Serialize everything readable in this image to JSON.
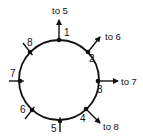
{
  "diagram": {
    "type": "ring-network",
    "center": [
      59,
      80
    ],
    "radius": 40,
    "stroke_color": "#111111",
    "nodes": [
      {
        "id": "1",
        "label": "1",
        "x": 59,
        "y": 40,
        "label_x": 64,
        "label_y": 36,
        "link": "out",
        "end_x": 59,
        "end_y": 20,
        "dest": "to 5",
        "dest_x": 52,
        "dest_y": 14
      },
      {
        "id": "2",
        "label": "2",
        "x": 88,
        "y": 52,
        "label_x": 89,
        "label_y": 62,
        "link": "out",
        "end_x": 100,
        "end_y": 37,
        "dest": "to 6",
        "dest_x": 105,
        "dest_y": 40
      },
      {
        "id": "3",
        "label": "3",
        "x": 98,
        "y": 81,
        "label_x": 97,
        "label_y": 93,
        "link": "out",
        "end_x": 118,
        "end_y": 81,
        "dest": "to 7",
        "dest_x": 121,
        "dest_y": 85
      },
      {
        "id": "4",
        "label": "4",
        "x": 86,
        "y": 109,
        "label_x": 80,
        "label_y": 122,
        "link": "out",
        "end_x": 100,
        "end_y": 123,
        "dest": "to 8",
        "dest_x": 103,
        "dest_y": 130
      },
      {
        "id": "5",
        "label": "5",
        "x": 60,
        "y": 121,
        "label_x": 51,
        "label_y": 132,
        "link": "in",
        "end_x": 60,
        "end_y": 132
      },
      {
        "id": "6",
        "label": "6",
        "x": 32,
        "y": 110,
        "label_x": 20,
        "label_y": 113,
        "link": "in",
        "end_x": 25,
        "end_y": 119
      },
      {
        "id": "7",
        "label": "7",
        "x": 20,
        "y": 81,
        "label_x": 10,
        "label_y": 77,
        "link": "in",
        "end_x": 9,
        "end_y": 81
      },
      {
        "id": "8",
        "label": "8",
        "x": 30,
        "y": 52,
        "label_x": 27,
        "label_y": 46,
        "link": "in",
        "end_x": 23,
        "end_y": 43
      }
    ]
  }
}
